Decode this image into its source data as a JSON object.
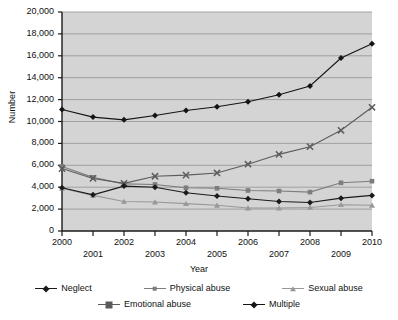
{
  "chart_data": {
    "type": "line",
    "title": "",
    "xlabel": "Year",
    "ylabel": "Number",
    "categories": [
      "2000",
      "2001",
      "2002",
      "2003",
      "2004",
      "2005",
      "2006",
      "2007",
      "2008",
      "2009",
      "2010"
    ],
    "x": [
      2000,
      2001,
      2002,
      2003,
      2004,
      2005,
      2006,
      2007,
      2008,
      2009,
      2010
    ],
    "ylim": [
      0,
      20000
    ],
    "xlim": [
      2000,
      2010
    ],
    "y_ticks": [
      0,
      2000,
      4000,
      6000,
      8000,
      10000,
      12000,
      14000,
      16000,
      18000,
      20000
    ],
    "y_tick_labels": [
      "0",
      "2,000",
      "4,000",
      "6,000",
      "8,000",
      "10,000",
      "12,000",
      "14,000",
      "16,000",
      "18,000",
      "20,000"
    ],
    "x_tick_labels": [
      "2000",
      "2001",
      "2002",
      "2003",
      "2004",
      "2005",
      "2006",
      "2007",
      "2008",
      "2009",
      "2010"
    ],
    "grid": "horizontal",
    "legend_position": "bottom",
    "plot_background": "#d4d4d4",
    "gridline_color": "#9a9a9a",
    "axis_color": "#1a1a1a",
    "series": [
      {
        "name": "Neglect",
        "marker": "diamond",
        "color": "#1a1a1a",
        "values": [
          3950,
          3300,
          4100,
          4000,
          3500,
          3200,
          2950,
          2700,
          2600,
          3000,
          3250
        ]
      },
      {
        "name": "Physical abuse",
        "marker": "square",
        "color": "#7d7d7d",
        "values": [
          5900,
          4900,
          4300,
          4250,
          3950,
          3900,
          3700,
          3650,
          3550,
          4400,
          4550
        ]
      },
      {
        "name": "Sexual abuse",
        "marker": "triangle",
        "color": "#989898",
        "values": [
          3900,
          3250,
          2700,
          2650,
          2500,
          2350,
          2100,
          2100,
          2150,
          2400,
          2350
        ]
      },
      {
        "name": "Emotional abuse",
        "marker": "cross",
        "color": "#5c5c5c",
        "values": [
          5700,
          4800,
          4350,
          5000,
          5100,
          5300,
          6100,
          7000,
          7700,
          9200,
          11300
        ]
      },
      {
        "name": "Multiple",
        "marker": "filled-diamond",
        "color": "#141414",
        "values": [
          11100,
          10400,
          10150,
          10550,
          11000,
          11350,
          11800,
          12450,
          13250,
          15800,
          17100
        ]
      }
    ]
  },
  "legend": {
    "row1": [
      "Neglect",
      "Physical abuse",
      "Sexual abuse"
    ],
    "row2": [
      "Emotional abuse",
      "Multiple"
    ]
  },
  "axes": {
    "y_title": "Number",
    "x_title": "Year"
  }
}
